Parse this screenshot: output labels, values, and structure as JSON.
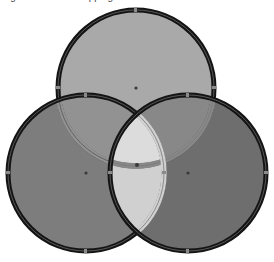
{
  "caption": {
    "text": "Figure: three overlapping circles"
  },
  "diagram": {
    "type": "venn-3",
    "circles": [
      {
        "id": "top",
        "cx": 136,
        "cy": 88,
        "r": 78,
        "fill": "#a9a9a9"
      },
      {
        "id": "left",
        "cx": 86,
        "cy": 173,
        "r": 78,
        "fill": "#7d7d7d"
      },
      {
        "id": "right",
        "cx": 188,
        "cy": 173,
        "r": 78,
        "fill": "#6e6e6e"
      }
    ],
    "overlaps": {
      "top_left": "#959595",
      "top_right": "#8a8a8a",
      "left_right": "#d2d2d2",
      "center": "#dedede"
    },
    "stroke": {
      "color": "#141414",
      "width": 5
    },
    "inner_stroke": "#5a5a5a",
    "handle_color": "#3a3a3a"
  }
}
